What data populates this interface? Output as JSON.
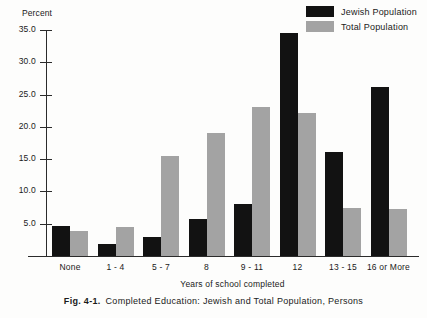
{
  "chart_data": {
    "type": "bar",
    "title": "",
    "xlabel": "Years of school completed",
    "ylabel": "Percent",
    "ylim": [
      0,
      35.0
    ],
    "yticks": [
      "5.0",
      "10.0",
      "15.0",
      "20.0",
      "25.0",
      "30.0",
      "35.0"
    ],
    "ytick_values": [
      5.0,
      10.0,
      15.0,
      20.0,
      25.0,
      30.0,
      35.0
    ],
    "grid": false,
    "legend_position": "top-right",
    "categories": [
      "None",
      "1 - 4",
      "5 - 7",
      "8",
      "9 - 11",
      "12",
      "13 - 15",
      "16 or More"
    ],
    "series": [
      {
        "name": "Jewish Population",
        "color": "#121212",
        "values": [
          4.6,
          1.9,
          3.0,
          5.8,
          8.1,
          34.5,
          16.1,
          26.2
        ]
      },
      {
        "name": "Total Population",
        "color": "#a3a3a3",
        "values": [
          3.8,
          4.5,
          15.5,
          19.0,
          23.1,
          22.2,
          7.5,
          7.3
        ]
      }
    ]
  },
  "legend": {
    "items": [
      {
        "label": "Jewish Population",
        "color": "#121212"
      },
      {
        "label": "Total Population",
        "color": "#a3a3a3"
      }
    ]
  },
  "caption": {
    "figure_number": "Fig. 4-1.",
    "text": "Completed Education: Jewish and Total Population, Persons"
  }
}
